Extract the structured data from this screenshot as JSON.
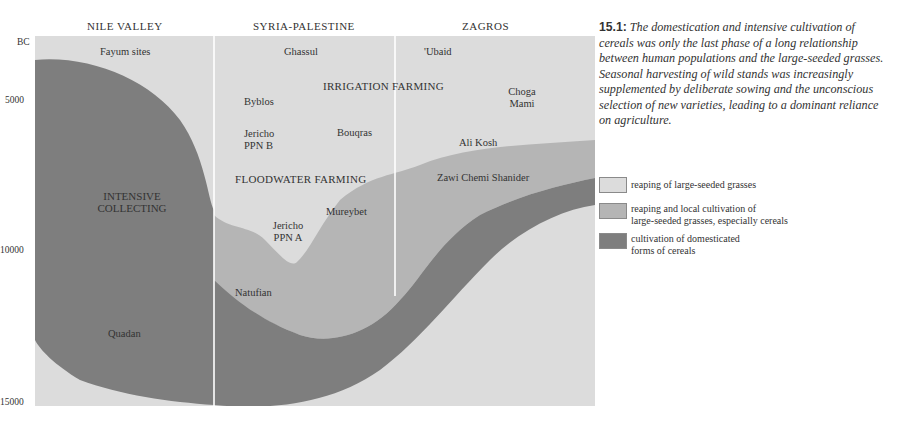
{
  "figure": {
    "number": "15.1:",
    "caption": "The domestication and intensive cultivation of cereals was only the last phase of a long relationship between human populations and the large-seeded grasses. Seasonal harvesting of wild stands was increasingly supplemented by deliberate sowing and the unconscious selection of new varieties, leading to a dominant reliance on agriculture."
  },
  "colors": {
    "light": "#dcdcdc",
    "medium": "#b5b5b5",
    "dark": "#7e7e7e",
    "divider": "#ffffff"
  },
  "regions": [
    {
      "name": "NILE VALLEY"
    },
    {
      "name": "SYRIA-PALESTINE"
    },
    {
      "name": "ZAGROS"
    }
  ],
  "y_axis": {
    "unit": "BC",
    "ticks": [
      "5000",
      "10000",
      "15000"
    ]
  },
  "labels": {
    "fayum": "Fayum sites",
    "ghassul": "Ghassul",
    "ubaid": "'Ubaid",
    "irrigation": "IRRIGATION FARMING",
    "choga": "Choga",
    "mami": "Mami",
    "byblos": "Byblos",
    "jericho_b1": "Jericho",
    "jericho_b2": "PPN B",
    "bouqras": "Bouqras",
    "alikosh": "Ali Kosh",
    "floodwater": "FLOODWATER FARMING",
    "zawi": "Zawi Chemi Shanider",
    "intensive1": "INTENSIVE",
    "intensive2": "COLLECTING",
    "mureybet": "Mureybet",
    "jericho_a1": "Jericho",
    "jericho_a2": "PPN A",
    "natufian": "Natufian",
    "quadan": "Quadan"
  },
  "legend": [
    {
      "label": "reaping of large-seeded grasses",
      "color": "#dcdcdc"
    },
    {
      "label": "reaping and local cultivation of large-seeded grasses, especially cereals",
      "line1": "reaping and local cultivation of",
      "line2": "large-seeded grasses, especially cereals",
      "color": "#b5b5b5"
    },
    {
      "label": "cultivation of domesticated forms of cereals",
      "line1": "cultivation of domesticated",
      "line2": "forms of cereals",
      "color": "#7e7e7e"
    }
  ]
}
